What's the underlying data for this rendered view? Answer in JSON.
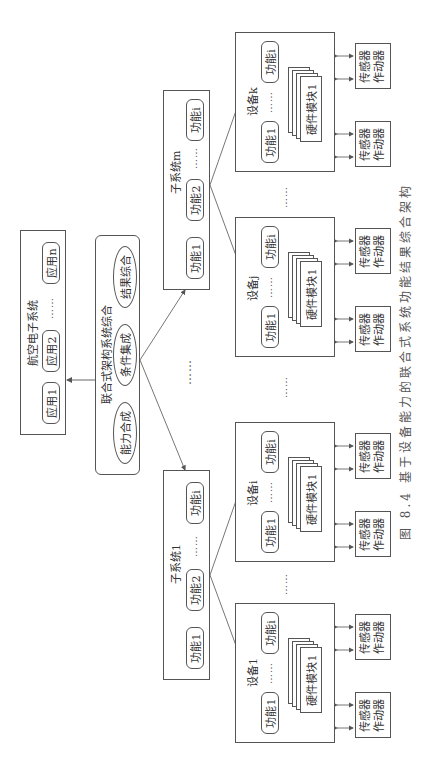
{
  "avionics": {
    "title": "航空电子系统",
    "apps": [
      "应用1",
      "应用2",
      "应用n"
    ],
    "ellipsis": "……"
  },
  "integration": {
    "title": "联合式架构系统综合",
    "items": [
      "能力合成",
      "条件集成",
      "结果综合"
    ]
  },
  "subsystems": [
    {
      "title": "子系统1",
      "functions": [
        "功能1",
        "功能2",
        "功能i"
      ],
      "ellipsis": "……"
    },
    {
      "title": "子系统m",
      "functions": [
        "功能1",
        "功能2",
        "功能i"
      ],
      "ellipsis": "……"
    }
  ],
  "devices": [
    {
      "title": "设备1",
      "functions": [
        "功能1",
        "功能i"
      ],
      "hardware": "硬件模块1",
      "ellipsis": "……"
    },
    {
      "title": "设备i",
      "functions": [
        "功能1",
        "功能i"
      ],
      "hardware": "硬件模块1",
      "ellipsis": "……"
    },
    {
      "title": "设备j",
      "functions": [
        "功能1",
        "功能i"
      ],
      "hardware": "硬件模块1",
      "ellipsis": "……"
    },
    {
      "title": "设备k",
      "functions": [
        "功能1",
        "功能i"
      ],
      "hardware": "硬件模块1",
      "ellipsis": "……"
    }
  ],
  "sensor": {
    "line1": "传感器",
    "line2": "作动器"
  },
  "between_ellipsis": "……",
  "caption": "图 8.4   基于设备能力的联合式系统功能结果综合架构"
}
